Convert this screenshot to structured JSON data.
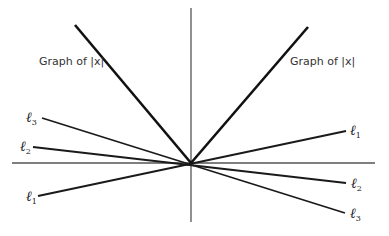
{
  "diagram": {
    "origin": {
      "x": 191,
      "y": 163
    },
    "axes": {
      "color": "#555555",
      "horizontal": {
        "x1": 12,
        "y1": 163,
        "x2": 375,
        "y2": 163
      },
      "vertical": {
        "x1": 191,
        "y1": 8,
        "x2": 191,
        "y2": 222
      }
    },
    "abs_graph": {
      "label_left": "Graph of |x|",
      "label_right": "Graph of |x|",
      "left_branch": {
        "x1": 75,
        "y1": 25,
        "x2": 191,
        "y2": 163
      },
      "right_branch": {
        "x1": 191,
        "y1": 163,
        "x2": 308,
        "y2": 27
      },
      "color": "#111111"
    },
    "lines": [
      {
        "name": "ℓ",
        "sub": "1",
        "x1": 38,
        "y1": 196,
        "x2": 346,
        "y2": 131
      },
      {
        "name": "ℓ",
        "sub": "2",
        "x1": 33,
        "y1": 147,
        "x2": 346,
        "y2": 183
      },
      {
        "name": "ℓ",
        "sub": "3",
        "x1": 42,
        "y1": 118,
        "x2": 345,
        "y2": 213
      }
    ],
    "labels": {
      "l1_left": "ℓ",
      "l1_left_sub": "1",
      "l1_right": "ℓ",
      "l1_right_sub": "1",
      "l2_left": "ℓ",
      "l2_left_sub": "2",
      "l2_right": "ℓ",
      "l2_right_sub": "2",
      "l3_left": "ℓ",
      "l3_left_sub": "3",
      "l3_right": "ℓ",
      "l3_right_sub": "3"
    }
  }
}
